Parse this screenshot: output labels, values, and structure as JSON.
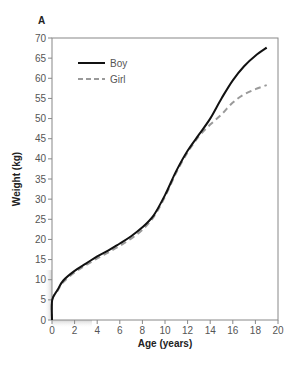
{
  "panel_label": "A",
  "colors": {
    "boy": "#111111",
    "girl": "#9a9a9a",
    "axis": "#888888",
    "tick_text": "#555555"
  },
  "chart_data": {
    "type": "line",
    "title": "",
    "panel": "A",
    "xlabel": "Age (years)",
    "ylabel": "Weight (kg)",
    "xlim": [
      0,
      20
    ],
    "ylim": [
      0,
      70
    ],
    "xticks": [
      0,
      2,
      4,
      6,
      8,
      10,
      12,
      14,
      16,
      18,
      20
    ],
    "yticks": [
      0,
      5,
      10,
      15,
      20,
      25,
      30,
      35,
      40,
      45,
      50,
      55,
      60,
      65,
      70
    ],
    "grid": false,
    "legend_position": "upper left",
    "series": [
      {
        "name": "Boy",
        "style": "solid",
        "x": [
          0,
          0.02,
          0.5,
          1,
          2,
          3,
          4,
          5,
          6,
          7,
          8,
          9,
          10,
          11,
          12,
          13,
          14,
          15,
          16,
          17,
          18,
          19
        ],
        "values": [
          0,
          5,
          7.5,
          9.8,
          12.2,
          14,
          15.8,
          17.3,
          19,
          20.8,
          23,
          26,
          31,
          37,
          42,
          46,
          50,
          55,
          59.5,
          63,
          65.6,
          67.6
        ]
      },
      {
        "name": "Girl",
        "style": "dashed",
        "x": [
          0,
          0.02,
          0.5,
          1,
          2,
          3,
          4,
          5,
          6,
          7,
          8,
          9,
          10,
          11,
          12,
          13,
          14,
          15,
          16,
          17,
          18,
          19
        ],
        "values": [
          0,
          5,
          7.3,
          9.4,
          11.8,
          13.6,
          15.3,
          16.8,
          18.4,
          20.2,
          22.4,
          25.6,
          30.6,
          36.6,
          41.6,
          45.6,
          48.5,
          51,
          54,
          56,
          57.3,
          58.3
        ]
      }
    ]
  }
}
